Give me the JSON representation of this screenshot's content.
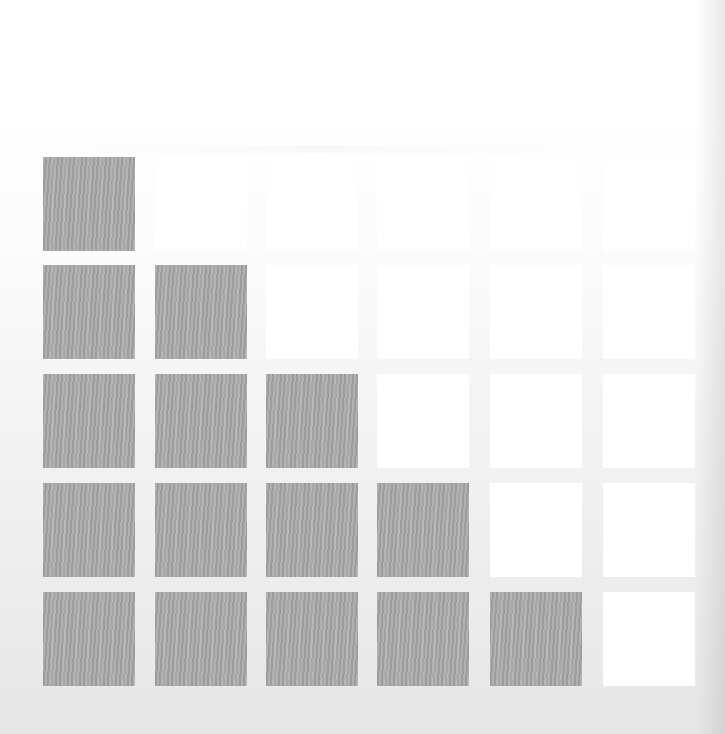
{
  "diagram": {
    "type": "staircase-grid",
    "rows": 5,
    "columns": 6,
    "colors": {
      "filled": "#a8a8a8",
      "empty": "#ffffff",
      "background_top": "#ffffff",
      "background_bottom": "#e6e6e6"
    },
    "layout": {
      "column_x": [
        43,
        155,
        266,
        377,
        490,
        603
      ],
      "row_y": [
        157,
        265,
        374,
        483,
        592
      ],
      "cell_width": 92,
      "cell_height": 94
    },
    "cells": [
      [
        1,
        0,
        0,
        0,
        0,
        0
      ],
      [
        1,
        1,
        0,
        0,
        0,
        0
      ],
      [
        1,
        1,
        1,
        0,
        0,
        0
      ],
      [
        1,
        1,
        1,
        1,
        0,
        0
      ],
      [
        1,
        1,
        1,
        1,
        1,
        0
      ]
    ],
    "filled_per_row": [
      1,
      2,
      3,
      4,
      5
    ]
  }
}
